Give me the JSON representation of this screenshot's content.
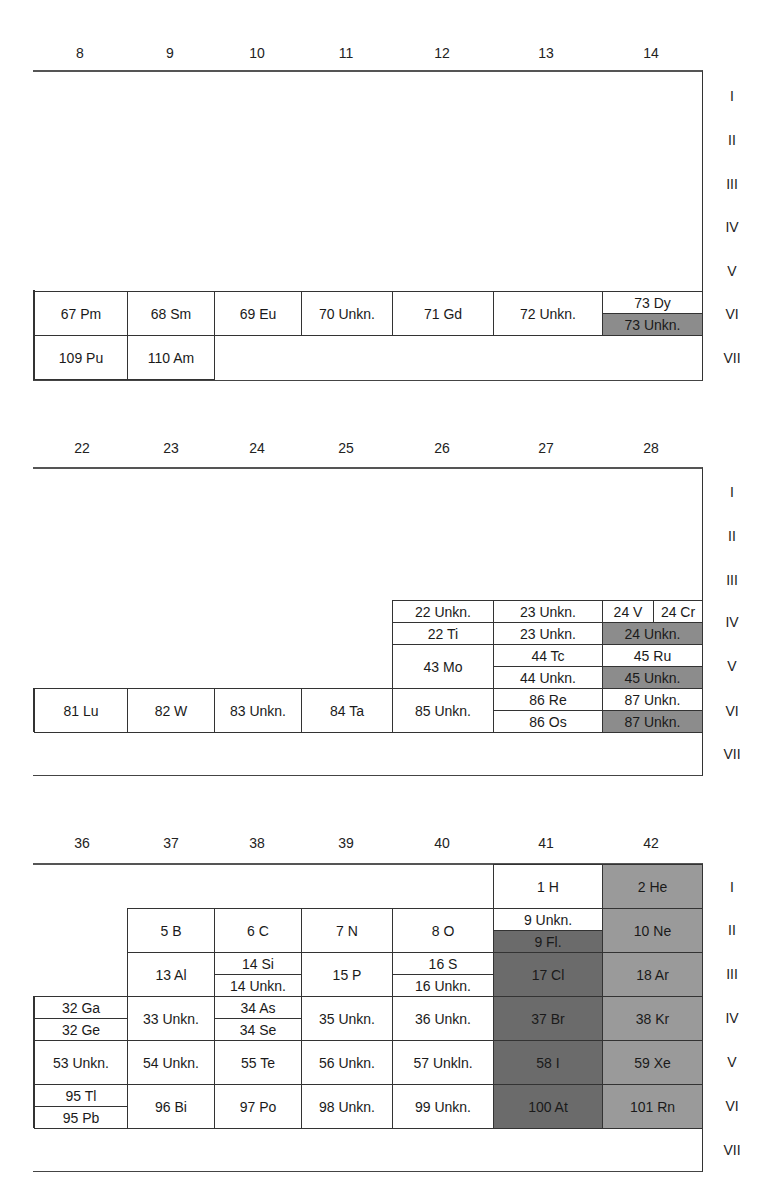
{
  "sections": [
    {
      "columns": [
        "8",
        "9",
        "10",
        "11",
        "12",
        "13",
        "14"
      ],
      "rows": [
        "I",
        "II",
        "III",
        "IV",
        "V",
        "VI",
        "VII"
      ],
      "cells": {
        "r6": [
          "67 Pm",
          "68 Sm",
          "69 Eu",
          "70 Unkn.",
          "71 Gd",
          "72 Unkn."
        ],
        "r6_split_top": "73 Dy",
        "r6_split_bottom": "73 Unkn.",
        "r7": [
          "109 Pu",
          "110 Am"
        ]
      }
    },
    {
      "columns": [
        "22",
        "23",
        "24",
        "25",
        "26",
        "27",
        "28"
      ],
      "rows": [
        "I",
        "II",
        "III",
        "IV",
        "V",
        "VI",
        "VII"
      ],
      "cells": {
        "r4_c26_top": "22 Unkn.",
        "r4_c26_bottom": "22 Ti",
        "r4_c27_top": "23 Unkn.",
        "r4_c27_bottom": "23 Unkn.",
        "r4_c28_top_left": "24 V",
        "r4_c28_top_right": "24 Cr",
        "r4_c28_bottom": "24 Unkn.",
        "r5_c26": "43 Mo",
        "r5_c27_top": "44 Tc",
        "r5_c27_bottom": "44 Unkn.",
        "r5_c28_top": "45 Ru",
        "r5_c28_bottom": "45 Unkn.",
        "r6": [
          "81 Lu",
          "82 W",
          "83 Unkn.",
          "84 Ta",
          "85 Unkn."
        ],
        "r6_c27_top": "86 Re",
        "r6_c27_bottom": "86 Os",
        "r6_c28_top": "87 Unkn.",
        "r6_c28_bottom": "87 Unkn."
      }
    },
    {
      "columns": [
        "36",
        "37",
        "38",
        "39",
        "40",
        "41",
        "42"
      ],
      "rows": [
        "I",
        "II",
        "III",
        "IV",
        "V",
        "VI",
        "VII"
      ],
      "cells": {
        "r1_c41": "1 H",
        "r1_c42": "2 He",
        "r2": [
          "5 B",
          "6 C",
          "7 N",
          "8 O"
        ],
        "r2_c41_top": "9 Unkn.",
        "r2_c41_bottom": "9 Fl.",
        "r2_c42": "10 Ne",
        "r3_c37": "13 Al",
        "r3_c38_top": "14 Si",
        "r3_c38_bottom": "14 Unkn.",
        "r3_c39": "15 P",
        "r3_c40_top": "16 S",
        "r3_c40_bottom": "16 Unkn.",
        "r3_c41": "17 Cl",
        "r3_c42": "18 Ar",
        "r4_c36_top": "32 Ga",
        "r4_c36_bottom": "32 Ge",
        "r4_c37": "33 Unkn.",
        "r4_c38_top": "34 As",
        "r4_c38_bottom": "34 Se",
        "r4_c39": "35 Unkn.",
        "r4_c40": "36 Unkn.",
        "r4_c41": "37 Br",
        "r4_c42": "38 Kr",
        "r5": [
          "53 Unkn.",
          "54 Unkn.",
          "55 Te",
          "56 Unkn.",
          "57 Unkln.",
          "58 I",
          "59 Xe"
        ],
        "r6_c36_top": "95 Tl",
        "r6_c36_bottom": "95 Pb",
        "r6": [
          "96 Bi",
          "97 Po",
          "98 Unkn.",
          "99 Unkn.",
          "100 At",
          "101 Rn"
        ]
      }
    }
  ],
  "colors": {
    "noble_gas": "#9a9a9a",
    "halogen": "#6b6b6b",
    "highlight": "#8c8c8c",
    "border": "#333333"
  }
}
